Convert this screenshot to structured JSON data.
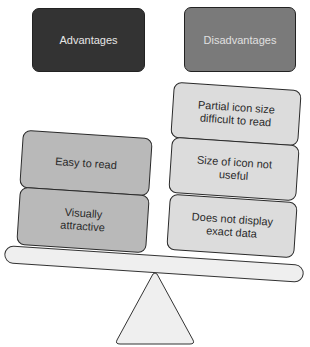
{
  "diagram": {
    "type": "balance-scale",
    "headers": {
      "advantages": "Advantages",
      "disadvantages": "Disadvantages"
    },
    "advantages": [
      {
        "label": "Easy to read"
      },
      {
        "label": "Visually attractive"
      }
    ],
    "disadvantages": [
      {
        "label": "Partial icon size difficult to read"
      },
      {
        "label": "Size of icon not useful"
      },
      {
        "label": "Does not display exact data"
      }
    ],
    "colors": {
      "advantages_header": "#333333",
      "disadvantages_header": "#7a7a7a",
      "advantage_box": "#b9b9b9",
      "disadvantage_box": "#dcdcdc",
      "beam": "#efefef"
    }
  }
}
